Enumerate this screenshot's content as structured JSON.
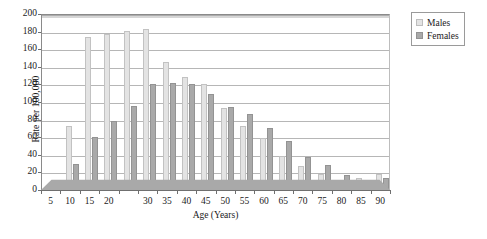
{
  "chart_data": {
    "type": "bar",
    "title": "",
    "xlabel": "Age (Years)",
    "ylabel": "Rate per 100,000",
    "ylim": [
      0,
      200
    ],
    "ytick_step": 20,
    "yticks": [
      0,
      20,
      40,
      60,
      80,
      100,
      120,
      140,
      160,
      180,
      200
    ],
    "grid": true,
    "legend_position": "top-right",
    "categories": [
      "5",
      "10",
      "15",
      "20",
      "25",
      "30",
      "35",
      "40",
      "45",
      "50",
      "55",
      "60",
      "65",
      "70",
      "75",
      "80",
      "85",
      "90"
    ],
    "xtick_labels": [
      "5",
      "10",
      "15",
      "20",
      "",
      "30",
      "35",
      "40",
      "45",
      "50",
      "55",
      "60",
      "65",
      "70",
      "75",
      "80",
      "85",
      "90"
    ],
    "series": [
      {
        "name": "Males",
        "color": "#e3e3e3",
        "values": [
          1,
          73,
          174,
          177,
          181,
          183,
          145,
          128,
          120,
          93,
          73,
          59,
          39,
          27,
          18,
          11,
          14,
          18
        ]
      },
      {
        "name": "Females",
        "color": "#a9a9a9",
        "values": [
          1,
          30,
          60,
          78,
          96,
          120,
          122,
          120,
          109,
          94,
          86,
          70,
          56,
          38,
          28,
          17,
          11,
          14
        ]
      }
    ]
  },
  "legend": {
    "items": [
      {
        "label": "Males",
        "swatch": "males"
      },
      {
        "label": "Females",
        "swatch": "females"
      }
    ]
  },
  "colors": {
    "males": "#e3e3e3",
    "females": "#a9a9a9",
    "axis": "#6f6f6f",
    "grid": "#9d9d9d",
    "floor": "#a9a9a9"
  }
}
